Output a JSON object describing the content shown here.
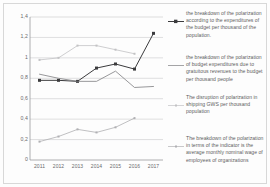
{
  "chart_data": {
    "type": "line",
    "title": "",
    "xlabel": "",
    "ylabel": "",
    "categories": [
      "2011",
      "2012",
      "2013",
      "2014",
      "2015",
      "2016",
      "2017"
    ],
    "x_tick_labels": [
      "2011",
      "2012",
      "2013",
      "2014",
      "2015",
      "2016",
      "2017"
    ],
    "y_tick_labels": [
      "0",
      "0,2",
      "0,4",
      "0,6",
      "0,8",
      "1",
      "1,2",
      "1,4"
    ],
    "y_tick_values": [
      0,
      0.2,
      0.4,
      0.6,
      0.8,
      1.0,
      1.2,
      1.4
    ],
    "ylim": [
      0,
      1.4
    ],
    "grid": true,
    "grid_axis": "y",
    "legend_position": "right",
    "series": [
      {
        "name": "budget-expenditures-per-thousand",
        "label": "the breakdown of the polarization according to the expenditures of the budget per thousand of the population.",
        "color": "#3b3b3d",
        "marker": "square",
        "values": [
          0.78,
          0.78,
          0.77,
          0.9,
          0.94,
          0.89,
          1.24
        ]
      },
      {
        "name": "gratuitous-revenues-per-thousand",
        "label": "the breakdown of the polarization of budget expenditures due to gratuitous revenues to the budget per thousand people",
        "color": "#7d7d80",
        "marker": "none",
        "values": [
          0.84,
          0.8,
          0.77,
          0.77,
          0.87,
          0.71,
          0.72
        ]
      },
      {
        "name": "shipping-gws-per-thousand",
        "label": "The disruption of polarization in shipping GWS per thousand population",
        "color": "#c2c2c4",
        "marker": "dot",
        "values": [
          0.98,
          1.0,
          1.12,
          1.12,
          1.08,
          1.04,
          null
        ]
      },
      {
        "name": "average-monthly-nominal-wage",
        "label": "The breakdown of the polarization in terms of the indicator is the average monthly nominal wage of employees of organizations",
        "color": "#b0b0b3",
        "marker": "dot",
        "values": [
          0.18,
          0.23,
          0.3,
          0.27,
          0.32,
          0.41,
          null
        ]
      }
    ]
  },
  "colors": {
    "grid": "#c9c9cb",
    "axis": "#9a9a9c",
    "background": "#fdfdfd",
    "border": "#d8d8d8",
    "text": "#5d5d5f"
  }
}
